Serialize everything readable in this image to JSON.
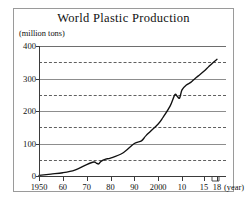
{
  "figure": {
    "title": "World Plastic Production",
    "y_unit_label": "(million tons)",
    "x_unit_label": "(year)"
  },
  "colors": {
    "background": "#ffffff",
    "frame": "#9a9a9a",
    "axis": "#3b3b3b",
    "gridline_solid": "#8d8d8d",
    "gridline_dashed": "#5f5f5f",
    "curve": "#111111",
    "text": "#111111"
  },
  "chart_data": {
    "type": "line",
    "title": "World Plastic Production",
    "xlabel": "(year)",
    "ylabel": "(million tons)",
    "xlim": [
      1950,
      2018
    ],
    "ylim": [
      0,
      400
    ],
    "grid": "horizontal solid every 100, dashed every 50",
    "legend": "none",
    "y_ticks": [
      0,
      100,
      200,
      300,
      400
    ],
    "y_tick_labels": [
      "0",
      "100",
      "200",
      "300",
      "400"
    ],
    "y_gridlines_solid": [
      0,
      100,
      200,
      300,
      400
    ],
    "y_gridlines_dashed": [
      50,
      150,
      250,
      350
    ],
    "x_ticks": [
      1950,
      1960,
      1970,
      1980,
      1990,
      2000,
      2010,
      2015,
      2018
    ],
    "x_tick_labels": [
      "1950",
      "60",
      "70",
      "80",
      "90",
      "2000",
      "10",
      "15",
      "18"
    ],
    "series": [
      {
        "name": "World plastic production",
        "x": [
          1950,
          1955,
          1960,
          1965,
          1970,
          1973,
          1974,
          1975,
          1976,
          1978,
          1980,
          1985,
          1990,
          1993,
          1995,
          2000,
          2002,
          2005,
          2007,
          2008,
          2009,
          2010,
          2011,
          2012,
          2013,
          2014,
          2015,
          2016,
          2017,
          2018
        ],
        "y": [
          2,
          6,
          10,
          18,
          35,
          43,
          40,
          37,
          45,
          52,
          55,
          70,
          100,
          108,
          125,
          160,
          180,
          215,
          250,
          245,
          240,
          265,
          280,
          288,
          300,
          311,
          322,
          335,
          348,
          359
        ]
      }
    ],
    "annotations": [
      "small dip around 1974-1975 (oil crisis)",
      "dip around 2008-2009 (financial crisis)"
    ]
  }
}
